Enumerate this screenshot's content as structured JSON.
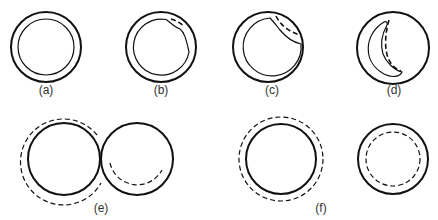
{
  "figure": {
    "panels": [
      {
        "id": "a",
        "label": "(a)",
        "content": "outer thick circle with concentric thin inner circle"
      },
      {
        "id": "b",
        "label": "(b)",
        "content": "inner circle with small bulge at upper right, short dashed arc"
      },
      {
        "id": "c",
        "label": "(c)",
        "content": "inner circle with larger indentation at upper right, dashed arc"
      },
      {
        "id": "d",
        "label": "(d)",
        "content": "crescent-shaped inner lumen on left, dashed curved line"
      },
      {
        "id": "e",
        "label": "(e)",
        "content": "two touching circles with partial dashed outer arcs"
      },
      {
        "id": "f",
        "label": "(f)",
        "content": "circle with outer dashed ring and circle with inner dashed ring"
      }
    ]
  },
  "labels": {
    "a": "(a)",
    "b": "(b)",
    "c": "(c)",
    "d": "(d)",
    "e": "(e)",
    "f": "(f)"
  }
}
